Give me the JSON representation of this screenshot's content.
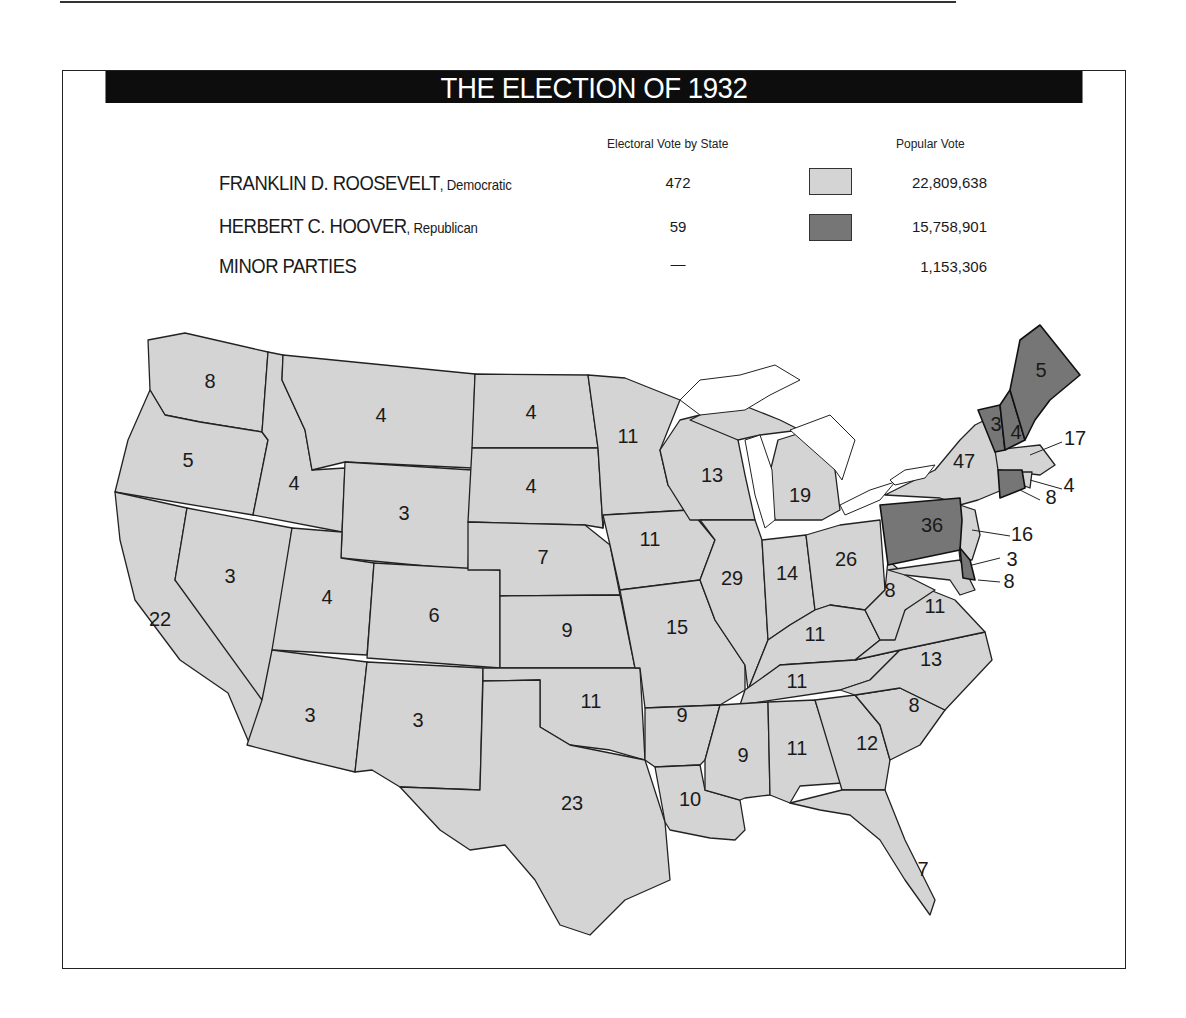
{
  "title": "THE ELECTION OF 1932",
  "legend": {
    "headers": {
      "electoral": "Electoral Vote by State",
      "popular": "Popular Vote"
    },
    "rows": [
      {
        "name": "FRANKLIN D. ROOSEVELT",
        "party": ", Democratic",
        "electoral": "472",
        "popular": "22,809,638",
        "color": "#d4d4d4"
      },
      {
        "name": "HERBERT C. HOOVER",
        "party": ", Republican",
        "electoral": "59",
        "popular": "15,758,901",
        "color": "#767676"
      },
      {
        "name": "MINOR PARTIES",
        "party": "",
        "electoral": "—",
        "popular": "1,153,306",
        "color": null
      }
    ]
  },
  "colors": {
    "democratic": "#d4d4d4",
    "republican": "#767676",
    "lakes": "#ffffff",
    "border": "#222222"
  },
  "states": [
    {
      "abbr": "WA",
      "ev": "8",
      "winner": "D"
    },
    {
      "abbr": "OR",
      "ev": "5",
      "winner": "D"
    },
    {
      "abbr": "CA",
      "ev": "22",
      "winner": "D"
    },
    {
      "abbr": "ID",
      "ev": "4",
      "winner": "D"
    },
    {
      "abbr": "NV",
      "ev": "3",
      "winner": "D"
    },
    {
      "abbr": "MT",
      "ev": "4",
      "winner": "D"
    },
    {
      "abbr": "WY",
      "ev": "3",
      "winner": "D"
    },
    {
      "abbr": "UT",
      "ev": "4",
      "winner": "D"
    },
    {
      "abbr": "AZ",
      "ev": "3",
      "winner": "D"
    },
    {
      "abbr": "CO",
      "ev": "6",
      "winner": "D"
    },
    {
      "abbr": "NM",
      "ev": "3",
      "winner": "D"
    },
    {
      "abbr": "ND",
      "ev": "4",
      "winner": "D"
    },
    {
      "abbr": "SD",
      "ev": "4",
      "winner": "D"
    },
    {
      "abbr": "NE",
      "ev": "7",
      "winner": "D"
    },
    {
      "abbr": "KS",
      "ev": "9",
      "winner": "D"
    },
    {
      "abbr": "OK",
      "ev": "11",
      "winner": "D"
    },
    {
      "abbr": "TX",
      "ev": "23",
      "winner": "D"
    },
    {
      "abbr": "MN",
      "ev": "11",
      "winner": "D"
    },
    {
      "abbr": "IA",
      "ev": "11",
      "winner": "D"
    },
    {
      "abbr": "MO",
      "ev": "15",
      "winner": "D"
    },
    {
      "abbr": "AR",
      "ev": "9",
      "winner": "D"
    },
    {
      "abbr": "LA",
      "ev": "10",
      "winner": "D"
    },
    {
      "abbr": "WI",
      "ev": "13",
      "winner": "D"
    },
    {
      "abbr": "IL",
      "ev": "29",
      "winner": "D"
    },
    {
      "abbr": "MI",
      "ev": "19",
      "winner": "D"
    },
    {
      "abbr": "IN",
      "ev": "14",
      "winner": "D"
    },
    {
      "abbr": "OH",
      "ev": "26",
      "winner": "D"
    },
    {
      "abbr": "KY",
      "ev": "11",
      "winner": "D"
    },
    {
      "abbr": "TN",
      "ev": "11",
      "winner": "D"
    },
    {
      "abbr": "MS",
      "ev": "9",
      "winner": "D"
    },
    {
      "abbr": "AL",
      "ev": "11",
      "winner": "D"
    },
    {
      "abbr": "GA",
      "ev": "12",
      "winner": "D"
    },
    {
      "abbr": "FL",
      "ev": "7",
      "winner": "D"
    },
    {
      "abbr": "SC",
      "ev": "8",
      "winner": "D"
    },
    {
      "abbr": "NC",
      "ev": "13",
      "winner": "D"
    },
    {
      "abbr": "VA",
      "ev": "11",
      "winner": "D"
    },
    {
      "abbr": "WV",
      "ev": "8",
      "winner": "D"
    },
    {
      "abbr": "MD",
      "ev": "8",
      "winner": "D"
    },
    {
      "abbr": "DE",
      "ev": "3",
      "winner": "R"
    },
    {
      "abbr": "PA",
      "ev": "36",
      "winner": "R"
    },
    {
      "abbr": "NJ",
      "ev": "16",
      "winner": "D"
    },
    {
      "abbr": "NY",
      "ev": "47",
      "winner": "D"
    },
    {
      "abbr": "CT",
      "ev": "8",
      "winner": "R"
    },
    {
      "abbr": "RI",
      "ev": "4",
      "winner": "D"
    },
    {
      "abbr": "MA",
      "ev": "17",
      "winner": "D"
    },
    {
      "abbr": "VT",
      "ev": "3",
      "winner": "R"
    },
    {
      "abbr": "NH",
      "ev": "4",
      "winner": "R"
    },
    {
      "abbr": "ME",
      "ev": "5",
      "winner": "R"
    }
  ]
}
